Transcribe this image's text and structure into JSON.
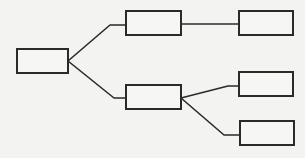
{
  "diagram": {
    "type": "tree",
    "colors": {
      "background": "#f3f3f1",
      "stroke": "#2a2a2a",
      "node_fill": "#f6f6f4"
    },
    "nodes": [
      {
        "id": "root",
        "label": "",
        "x": 17,
        "y": 49,
        "w": 51,
        "h": 24
      },
      {
        "id": "child-top",
        "label": "",
        "x": 126,
        "y": 11,
        "w": 55,
        "h": 24
      },
      {
        "id": "child-bottom",
        "label": "",
        "x": 126,
        "y": 85,
        "w": 55,
        "h": 24
      },
      {
        "id": "leaf-top",
        "label": "",
        "x": 239,
        "y": 11,
        "w": 54,
        "h": 24
      },
      {
        "id": "leaf-middle",
        "label": "",
        "x": 239,
        "y": 72,
        "w": 54,
        "h": 24
      },
      {
        "id": "leaf-bottom",
        "label": "",
        "x": 240,
        "y": 121,
        "w": 54,
        "h": 24
      }
    ],
    "edges": [
      {
        "from": "root",
        "to": "child-top",
        "points": "68,61 110,25 126,25"
      },
      {
        "from": "root",
        "to": "child-bottom",
        "points": "68,61 114,98 126,98"
      },
      {
        "from": "child-top",
        "to": "leaf-top",
        "points": "181,24 239,24"
      },
      {
        "from": "child-bottom",
        "to": "leaf-middle",
        "points": "181,98 228,86 239,86"
      },
      {
        "from": "child-bottom",
        "to": "leaf-bottom",
        "points": "181,98 224,135 240,135"
      }
    ]
  }
}
